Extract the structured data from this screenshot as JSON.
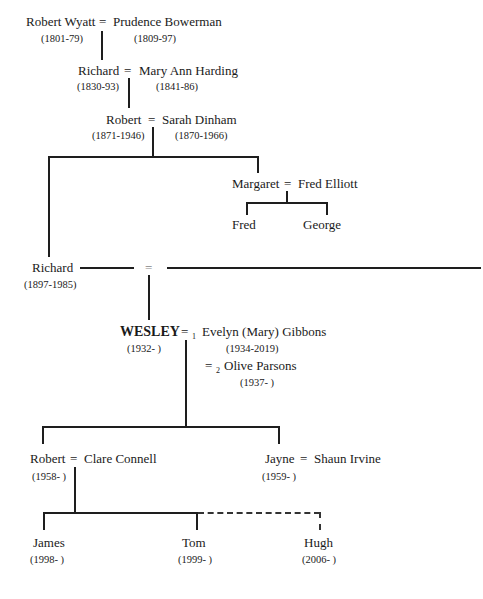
{
  "tree": {
    "gen1": {
      "husband": {
        "name": "Robert Wyatt",
        "dates": "(1801-79)"
      },
      "eq": "=",
      "wife": {
        "name": "Prudence Bowerman",
        "dates": "(1809-97)"
      }
    },
    "gen2": {
      "husband": {
        "name": "Richard",
        "dates": "(1830-93)"
      },
      "eq": "=",
      "wife": {
        "name": "Mary Ann Harding",
        "dates": "(1841-86)"
      }
    },
    "gen3": {
      "husband": {
        "name": "Robert",
        "dates": "(1871-1946)"
      },
      "eq": "=",
      "wife": {
        "name": "Sarah Dinham",
        "dates": "(1870-1966)"
      }
    },
    "margaret_family": {
      "wife": {
        "name": "Margaret"
      },
      "eq": "=",
      "husband": {
        "name": "Fred Elliott"
      },
      "children": [
        {
          "name": "Fred"
        },
        {
          "name": "George"
        }
      ]
    },
    "gen4": {
      "husband": {
        "name": "Richard",
        "dates": "(1897-1985)"
      },
      "eq": "="
    },
    "gen5": {
      "subject": {
        "name": "WESLEY",
        "dates": "(1932- )"
      },
      "eq": "=",
      "spouse1": {
        "marker": "1",
        "name": "Evelyn (Mary) Gibbons",
        "dates": "(1934-2019)"
      },
      "spouse2": {
        "marker": "2",
        "name": "Olive Parsons",
        "dates": "(1937- )"
      }
    },
    "gen6": {
      "robert_family": {
        "husband": {
          "name": "Robert",
          "dates": "(1958- )"
        },
        "eq": "=",
        "wife": {
          "name": "Clare Connell"
        }
      },
      "jayne_family": {
        "wife": {
          "name": "Jayne",
          "dates": "(1959- )"
        },
        "eq": "=",
        "husband": {
          "name": "Shaun Irvine"
        }
      }
    },
    "gen7": {
      "children": [
        {
          "name": "James",
          "dates": "(1998- )"
        },
        {
          "name": "Tom",
          "dates": "(1999- )"
        },
        {
          "name": "Hugh",
          "dates": "(2006- )"
        }
      ]
    }
  }
}
